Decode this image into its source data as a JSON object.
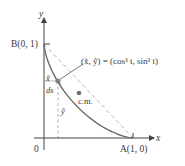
{
  "diagram": {
    "type": "astroid-arc-center-of-mass",
    "axes": {
      "x_label": "x",
      "y_label": "y",
      "origin_label": "0"
    },
    "points": {
      "B": "B(0, 1)",
      "A": "A(1, 0)"
    },
    "annotations": {
      "parametric": "(x̃, ỹ) = (cos³ t, sin³ t)",
      "x_tilde": "x̃",
      "y_tilde": "ỹ",
      "ds": "ds",
      "center_of_mass": "c.m."
    },
    "colors": {
      "curve": "#6b6b6b",
      "axes": "#444444",
      "dashed": "#b0b0b0",
      "point": "#7a7a7a",
      "text": "#3a3a3a"
    }
  }
}
